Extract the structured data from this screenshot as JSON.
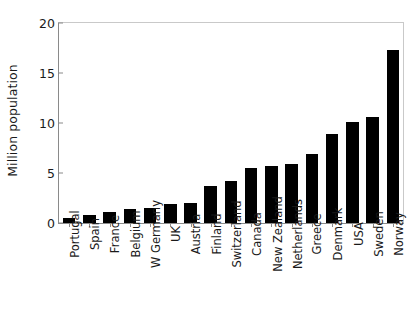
{
  "chart_data": {
    "type": "bar",
    "title": "",
    "subtitle": "",
    "xlabel": "",
    "ylabel": "Million population",
    "ylim": [
      0,
      20
    ],
    "ytick_labels": [
      "0",
      "5",
      "10",
      "15",
      "20"
    ],
    "ytick_values": [
      0,
      5,
      10,
      15,
      20
    ],
    "grid": false,
    "legend": false,
    "bar_color": "#000000",
    "axis_color": "#8a8a8a",
    "categories": [
      "Portugal",
      "Spain",
      "France",
      "Belgium",
      "W Germany",
      "UK",
      "Austria",
      "Finland",
      "Switzerland",
      "Canada",
      "New Zealand",
      "Netherlands",
      "Greece",
      "Denmark",
      "USA",
      "Sweden",
      "Norway"
    ],
    "values": [
      0.5,
      0.8,
      1.1,
      1.4,
      1.5,
      1.9,
      2.0,
      3.7,
      4.2,
      5.5,
      5.7,
      5.9,
      6.9,
      8.9,
      10.1,
      10.6,
      17.3
    ]
  }
}
